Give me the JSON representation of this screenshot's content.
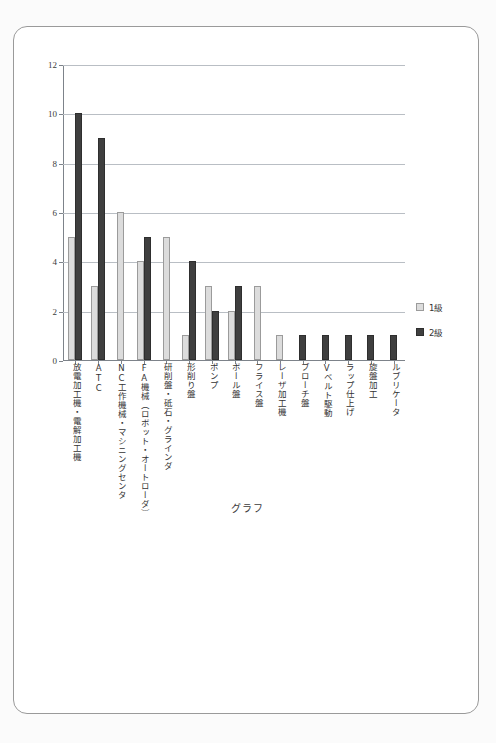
{
  "page": {
    "background_color": "#fbfbfb",
    "frame_color": "#9a9a9a"
  },
  "legend": {
    "position": "right",
    "items": [
      {
        "label": "1級",
        "color": "#dcdcdc",
        "name": "series-1kyu"
      },
      {
        "label": "2級",
        "color": "#3f3f3f",
        "name": "series-2kyu"
      }
    ]
  },
  "chart_data": {
    "type": "bar",
    "title": "グラフ",
    "xlabel": "",
    "ylabel": "",
    "ylim": [
      0,
      12
    ],
    "ytick_values": [
      0,
      2,
      4,
      6,
      8,
      10,
      12
    ],
    "ytick_labels": [
      "0",
      "2",
      "4",
      "6",
      "8",
      "10",
      "12"
    ],
    "grid": true,
    "grid_axis": "y",
    "legend_position": "right",
    "categories": [
      "放電加工機・電解加工機",
      "ATC",
      "NC工作機械・マシニングセンタ",
      "FA機械（ロボット・オートローダ）",
      "研削盤・砥石・グラインダ",
      "形削り盤",
      "ポンプ",
      "ボール盤",
      "フライス盤",
      "レーザ加工機",
      "ブローチ盤",
      "Vベルト駆動",
      "ラップ仕上げ",
      "旋盤加工",
      "ルブリケータ"
    ],
    "series": [
      {
        "name": "1級",
        "color": "#dcdcdc",
        "values": [
          5,
          3,
          6,
          4,
          5,
          1,
          3,
          2,
          3,
          1,
          0,
          0,
          0,
          0,
          0
        ]
      },
      {
        "name": "2級",
        "color": "#3f3f3f",
        "values": [
          10,
          9,
          0,
          5,
          0,
          4,
          2,
          3,
          0,
          0,
          1,
          1,
          1,
          1,
          1
        ]
      }
    ]
  }
}
